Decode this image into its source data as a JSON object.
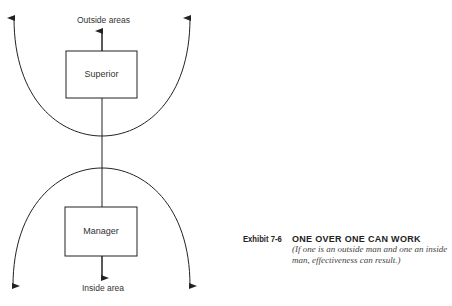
{
  "diagram": {
    "top_label": "Outside areas",
    "bottom_label": "Inside area",
    "boxes": [
      {
        "label": "Superior"
      },
      {
        "label": "Manager"
      }
    ],
    "line_color": "#222222"
  },
  "caption": {
    "exhibit_number": "Exhibit 7-6",
    "title": "ONE OVER ONE CAN WORK",
    "subtitle": "(If one is an outside man and one an inside man, effectiveness can result.)"
  }
}
